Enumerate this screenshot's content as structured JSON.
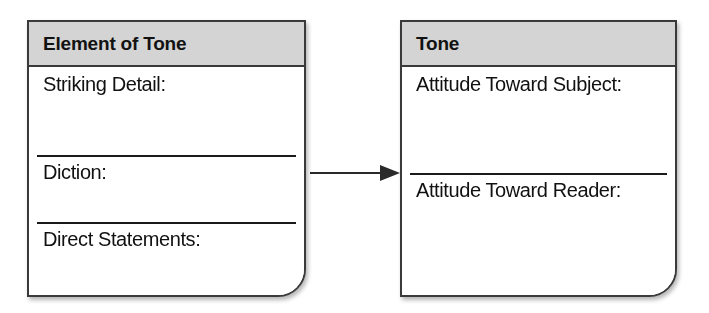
{
  "diagram": {
    "type": "graphic-organizer",
    "connector": {
      "icon": "arrow-right-icon",
      "from": "Element of Tone",
      "to": "Tone",
      "direction": "left-to-right"
    },
    "colors": {
      "header_background": "#d4d4d4",
      "border": "#3a3a3a",
      "text": "#111111",
      "page_background": "#ffffff"
    },
    "boxes": [
      {
        "id": "element-of-tone",
        "title": "Element of Tone",
        "fields": [
          {
            "label": "Striking Detail:"
          },
          {
            "label": "Diction:"
          },
          {
            "label": "Direct Statements:"
          }
        ]
      },
      {
        "id": "tone",
        "title": "Tone",
        "fields": [
          {
            "label": "Attitude Toward Subject:"
          },
          {
            "label": "Attitude Toward Reader:"
          }
        ]
      }
    ]
  }
}
